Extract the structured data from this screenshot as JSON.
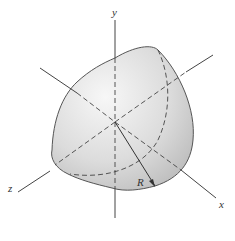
{
  "diagram": {
    "type": "3d-solid-octant-of-ellipsoid/sphere",
    "axes": {
      "y_label": "y",
      "x_label": "x",
      "z_label": "z"
    },
    "dimension_label": "R",
    "colors": {
      "outline": "#555555",
      "shade_light": "#f4f4f4",
      "shade_dark": "#c4c4c4",
      "axis": "#444444"
    }
  }
}
